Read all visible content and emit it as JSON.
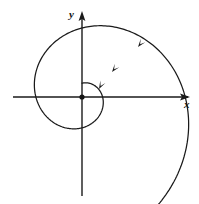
{
  "figure": {
    "kind": "phase-portrait",
    "title": "",
    "background_color": "#ffffff",
    "stroke_color": "#1a1a1a",
    "canvas": {
      "width": 199,
      "height": 204
    }
  },
  "axes": {
    "origin": {
      "x": 82,
      "y": 97
    },
    "x_axis": {
      "label": "x",
      "label_position": {
        "x": 184,
        "y": 99
      },
      "start": {
        "x": 13,
        "y": 97
      },
      "end": {
        "x": 190,
        "y": 97
      },
      "arrow_at": "end",
      "stroke_width": 1.4
    },
    "y_axis": {
      "label": "y",
      "label_position": {
        "x": 69,
        "y": 9
      },
      "start": {
        "x": 82,
        "y": 196
      },
      "end": {
        "x": 82,
        "y": 12
      },
      "arrow_at": "end",
      "stroke_width": 1.4
    }
  },
  "equilibrium_point": {
    "name": "origin-dot",
    "center": {
      "x": 82,
      "y": 97
    },
    "radius": 2.6,
    "fill": "#141414",
    "type": "stable-spiral-focus"
  },
  "spiral": {
    "name": "inward-logarithmic-spiral",
    "direction": "clockwise-inward",
    "turns": 3.45,
    "a": 1.05,
    "b": 0.2565,
    "theta_start_deg": 1242,
    "theta_end_deg": 0,
    "stroke_width": 1.25,
    "outer_tail_end": {
      "x": 22,
      "y": 168
    },
    "crossings": {
      "top_y_axis": {
        "x": 82,
        "y": 28
      },
      "right_x_axis": {
        "x": 157,
        "y": 97
      },
      "left_x_axis": {
        "x": 25,
        "y": 97
      },
      "bottom_y_axis": {
        "x": 82,
        "y": 185
      }
    }
  },
  "arrowheads": [
    {
      "name": "arrowhead-outer",
      "position": {
        "x": 138,
        "y": 47
      },
      "angle_deg": 128,
      "on_turn": "outermost"
    },
    {
      "name": "arrowhead-middle",
      "position": {
        "x": 112,
        "y": 72
      },
      "angle_deg": 128,
      "on_turn": "middle"
    },
    {
      "name": "arrowhead-inner",
      "position": {
        "x": 99,
        "y": 89
      },
      "angle_deg": 118,
      "on_turn": "inner"
    }
  ],
  "caption": ""
}
